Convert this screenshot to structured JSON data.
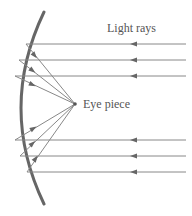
{
  "diagram": {
    "type": "concave-mirror-ray-diagram",
    "labels": {
      "light_rays": "Light rays",
      "eye_piece": "Eye piece"
    },
    "colors": {
      "mirror": "#666666",
      "rays": "#777777",
      "text": "#555555",
      "background": "#ffffff"
    },
    "focal_point": {
      "x": 75,
      "y": 104
    },
    "incoming_rays": [
      {
        "y": 44,
        "mirror_x": 26
      },
      {
        "y": 60,
        "mirror_x": 19
      },
      {
        "y": 76,
        "mirror_x": 15
      },
      {
        "y": 140,
        "mirror_x": 15
      },
      {
        "y": 156,
        "mirror_x": 20
      },
      {
        "y": 172,
        "mirror_x": 27
      }
    ]
  }
}
